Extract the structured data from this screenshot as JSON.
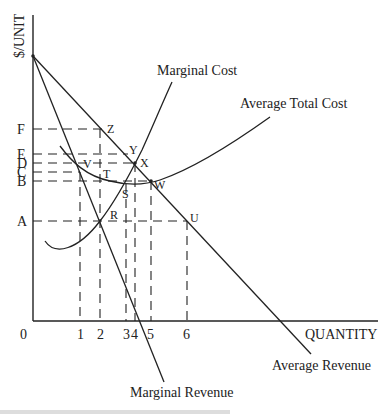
{
  "diagram": {
    "axes": {
      "y_label": "$/UNIT",
      "x_label": "QUANTITY",
      "origin_label": "0"
    },
    "price_levels": [
      "F",
      "E",
      "D",
      "C",
      "B",
      "A"
    ],
    "quantity_levels": [
      "1",
      "2",
      "3",
      "4",
      "5",
      "6"
    ],
    "curves": {
      "mc": "Marginal Cost",
      "atc": "Average Total Cost",
      "ar": "Average Revenue",
      "mr": "Marginal Revenue"
    },
    "points": [
      "Z",
      "Y",
      "X",
      "V",
      "T",
      "W",
      "S",
      "R",
      "U"
    ],
    "caption_partial": "t... m... ... d... ... ... ...",
    "colors": {
      "ink": "#222222",
      "background": "#ffffff"
    }
  }
}
